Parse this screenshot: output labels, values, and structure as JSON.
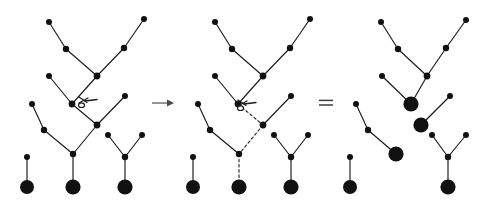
{
  "figure": {
    "background_color": "#ffffff",
    "ink_color": "#111111",
    "width": 487,
    "height": 203
  },
  "operators": [
    {
      "id": "arrow",
      "name": "right-arrow",
      "glyph": "→",
      "x": 163,
      "y": 103
    },
    {
      "id": "equals",
      "name": "equals-sign",
      "glyph": "=",
      "x": 326,
      "y": 103
    }
  ],
  "annotations": [
    {
      "id": "scissors-left",
      "name": "scissors-cut-icon",
      "label": "cut",
      "x": 84,
      "y": 104,
      "panel": "left"
    },
    {
      "id": "scissors-mid",
      "name": "scissors-cut-icon",
      "label": "cut",
      "x": 243,
      "y": 107,
      "panel": "middle"
    }
  ],
  "panels": [
    {
      "id": "panel-left",
      "name": "forest-before-cut",
      "caption": "",
      "nodes": [
        {
          "id": "L1",
          "x": 49,
          "y": 22,
          "r": 3.0,
          "kind": "leaf"
        },
        {
          "id": "L2",
          "x": 66,
          "y": 49,
          "r": 3.2,
          "kind": "internal"
        },
        {
          "id": "L3",
          "x": 97,
          "y": 76,
          "r": 3.4,
          "kind": "internal"
        },
        {
          "id": "L4",
          "x": 124,
          "y": 48,
          "r": 3.2,
          "kind": "internal"
        },
        {
          "id": "L5",
          "x": 144,
          "y": 19,
          "r": 3.0,
          "kind": "leaf"
        },
        {
          "id": "L6",
          "x": 49,
          "y": 76,
          "r": 3.0,
          "kind": "leaf"
        },
        {
          "id": "L7",
          "x": 72,
          "y": 104,
          "r": 3.4,
          "kind": "internal"
        },
        {
          "id": "L8",
          "x": 32,
          "y": 104,
          "r": 3.0,
          "kind": "leaf"
        },
        {
          "id": "L9",
          "x": 44,
          "y": 130,
          "r": 3.2,
          "kind": "internal"
        },
        {
          "id": "L10",
          "x": 97,
          "y": 125,
          "r": 3.4,
          "kind": "internal"
        },
        {
          "id": "L11",
          "x": 125,
          "y": 96,
          "r": 3.0,
          "kind": "leaf"
        },
        {
          "id": "L12",
          "x": 73,
          "y": 154,
          "r": 3.2,
          "kind": "internal"
        },
        {
          "id": "L13",
          "x": 108,
          "y": 135,
          "r": 3.0,
          "kind": "leaf"
        },
        {
          "id": "L14",
          "x": 142,
          "y": 135,
          "r": 3.0,
          "kind": "leaf"
        },
        {
          "id": "L15",
          "x": 125,
          "y": 157,
          "r": 3.2,
          "kind": "internal"
        },
        {
          "id": "L16",
          "x": 27,
          "y": 157,
          "r": 3.0,
          "kind": "leaf"
        },
        {
          "id": "R1",
          "x": 27,
          "y": 187,
          "r": 7.0,
          "kind": "root"
        },
        {
          "id": "R2",
          "x": 73,
          "y": 187,
          "r": 7.6,
          "kind": "root"
        },
        {
          "id": "R3",
          "x": 125,
          "y": 187,
          "r": 7.6,
          "kind": "root"
        }
      ],
      "edges": [
        {
          "from": "L1",
          "to": "L2",
          "style": "solid"
        },
        {
          "from": "L2",
          "to": "L3",
          "style": "solid"
        },
        {
          "from": "L5",
          "to": "L4",
          "style": "solid"
        },
        {
          "from": "L4",
          "to": "L3",
          "style": "solid"
        },
        {
          "from": "L3",
          "to": "L7",
          "style": "solid"
        },
        {
          "from": "L6",
          "to": "L7",
          "style": "solid"
        },
        {
          "from": "L7",
          "to": "L10",
          "style": "solid"
        },
        {
          "from": "L8",
          "to": "L9",
          "style": "solid"
        },
        {
          "from": "L9",
          "to": "L12",
          "style": "solid"
        },
        {
          "from": "L10",
          "to": "L12",
          "style": "solid"
        },
        {
          "from": "L11",
          "to": "L10",
          "style": "solid"
        },
        {
          "from": "L13",
          "to": "L15",
          "style": "solid"
        },
        {
          "from": "L14",
          "to": "L15",
          "style": "solid"
        },
        {
          "from": "L15",
          "to": "R3",
          "style": "solid"
        },
        {
          "from": "L12",
          "to": "R2",
          "style": "solid"
        },
        {
          "from": "L16",
          "to": "R1",
          "style": "solid"
        }
      ]
    },
    {
      "id": "panel-middle",
      "name": "forest-cut-highlighted",
      "caption": "",
      "nodes": [
        {
          "id": "M1",
          "x": 215,
          "y": 22,
          "r": 3.0,
          "kind": "leaf"
        },
        {
          "id": "M2",
          "x": 232,
          "y": 49,
          "r": 3.2,
          "kind": "internal"
        },
        {
          "id": "M3",
          "x": 263,
          "y": 76,
          "r": 3.4,
          "kind": "internal"
        },
        {
          "id": "M4",
          "x": 290,
          "y": 48,
          "r": 3.2,
          "kind": "internal"
        },
        {
          "id": "M5",
          "x": 310,
          "y": 19,
          "r": 3.0,
          "kind": "leaf"
        },
        {
          "id": "M6",
          "x": 215,
          "y": 76,
          "r": 3.0,
          "kind": "leaf"
        },
        {
          "id": "M7",
          "x": 238,
          "y": 104,
          "r": 3.4,
          "kind": "internal"
        },
        {
          "id": "M8",
          "x": 198,
          "y": 104,
          "r": 3.0,
          "kind": "leaf"
        },
        {
          "id": "M9",
          "x": 210,
          "y": 130,
          "r": 3.2,
          "kind": "internal"
        },
        {
          "id": "M10",
          "x": 263,
          "y": 125,
          "r": 3.4,
          "kind": "internal"
        },
        {
          "id": "M11",
          "x": 291,
          "y": 96,
          "r": 3.0,
          "kind": "leaf"
        },
        {
          "id": "M12",
          "x": 239,
          "y": 154,
          "r": 3.2,
          "kind": "internal"
        },
        {
          "id": "M13",
          "x": 274,
          "y": 135,
          "r": 3.0,
          "kind": "leaf"
        },
        {
          "id": "M14",
          "x": 308,
          "y": 135,
          "r": 3.0,
          "kind": "leaf"
        },
        {
          "id": "M15",
          "x": 291,
          "y": 157,
          "r": 3.2,
          "kind": "internal"
        },
        {
          "id": "M16",
          "x": 193,
          "y": 157,
          "r": 3.0,
          "kind": "leaf"
        },
        {
          "id": "S1",
          "x": 193,
          "y": 187,
          "r": 7.0,
          "kind": "root"
        },
        {
          "id": "S2",
          "x": 239,
          "y": 187,
          "r": 7.6,
          "kind": "root"
        },
        {
          "id": "S3",
          "x": 291,
          "y": 187,
          "r": 7.6,
          "kind": "root"
        }
      ],
      "edges": [
        {
          "from": "M1",
          "to": "M2",
          "style": "solid"
        },
        {
          "from": "M2",
          "to": "M3",
          "style": "solid"
        },
        {
          "from": "M5",
          "to": "M4",
          "style": "solid"
        },
        {
          "from": "M4",
          "to": "M3",
          "style": "solid"
        },
        {
          "from": "M3",
          "to": "M7",
          "style": "solid"
        },
        {
          "from": "M6",
          "to": "M7",
          "style": "solid"
        },
        {
          "from": "M7",
          "to": "M10",
          "style": "dashed"
        },
        {
          "from": "M8",
          "to": "M9",
          "style": "solid"
        },
        {
          "from": "M9",
          "to": "M12",
          "style": "solid"
        },
        {
          "from": "M10",
          "to": "M12",
          "style": "dashed"
        },
        {
          "from": "M11",
          "to": "M10",
          "style": "solid"
        },
        {
          "from": "M13",
          "to": "M15",
          "style": "solid"
        },
        {
          "from": "M14",
          "to": "M15",
          "style": "solid"
        },
        {
          "from": "M15",
          "to": "S3",
          "style": "solid"
        },
        {
          "from": "M12",
          "to": "S2",
          "style": "dashed"
        },
        {
          "from": "M16",
          "to": "S1",
          "style": "solid"
        }
      ]
    },
    {
      "id": "panel-right",
      "name": "forest-after-cut",
      "caption": "",
      "nodes": [
        {
          "id": "N1",
          "x": 381,
          "y": 22,
          "r": 3.0,
          "kind": "leaf"
        },
        {
          "id": "N2",
          "x": 398,
          "y": 49,
          "r": 3.2,
          "kind": "internal"
        },
        {
          "id": "N3",
          "x": 427,
          "y": 76,
          "r": 3.4,
          "kind": "internal"
        },
        {
          "id": "N4",
          "x": 446,
          "y": 48,
          "r": 3.2,
          "kind": "internal"
        },
        {
          "id": "N5",
          "x": 466,
          "y": 20,
          "r": 3.0,
          "kind": "leaf"
        },
        {
          "id": "N6",
          "x": 382,
          "y": 76,
          "r": 3.0,
          "kind": "leaf"
        },
        {
          "id": "T1",
          "x": 411,
          "y": 104,
          "r": 7.6,
          "kind": "root"
        },
        {
          "id": "N8",
          "x": 356,
          "y": 104,
          "r": 3.0,
          "kind": "leaf"
        },
        {
          "id": "N9",
          "x": 368,
          "y": 130,
          "r": 3.2,
          "kind": "internal"
        },
        {
          "id": "T2",
          "x": 396,
          "y": 154,
          "r": 7.6,
          "kind": "root"
        },
        {
          "id": "T3",
          "x": 421,
          "y": 125,
          "r": 7.6,
          "kind": "root"
        },
        {
          "id": "N11",
          "x": 450,
          "y": 96,
          "r": 3.0,
          "kind": "leaf"
        },
        {
          "id": "N13",
          "x": 432,
          "y": 135,
          "r": 3.0,
          "kind": "leaf"
        },
        {
          "id": "N14",
          "x": 466,
          "y": 135,
          "r": 3.0,
          "kind": "leaf"
        },
        {
          "id": "N15",
          "x": 448,
          "y": 157,
          "r": 3.2,
          "kind": "internal"
        },
        {
          "id": "N16",
          "x": 350,
          "y": 157,
          "r": 3.0,
          "kind": "leaf"
        },
        {
          "id": "T4",
          "x": 350,
          "y": 187,
          "r": 7.0,
          "kind": "root"
        },
        {
          "id": "T5",
          "x": 448,
          "y": 187,
          "r": 7.6,
          "kind": "root"
        }
      ],
      "edges": [
        {
          "from": "N1",
          "to": "N2",
          "style": "solid"
        },
        {
          "from": "N2",
          "to": "N3",
          "style": "solid"
        },
        {
          "from": "N5",
          "to": "N4",
          "style": "solid"
        },
        {
          "from": "N4",
          "to": "N3",
          "style": "solid"
        },
        {
          "from": "N3",
          "to": "T1",
          "style": "solid"
        },
        {
          "from": "N6",
          "to": "T1",
          "style": "solid"
        },
        {
          "from": "N8",
          "to": "N9",
          "style": "solid"
        },
        {
          "from": "N9",
          "to": "T2",
          "style": "solid"
        },
        {
          "from": "N11",
          "to": "T3",
          "style": "solid"
        },
        {
          "from": "N13",
          "to": "N15",
          "style": "solid"
        },
        {
          "from": "N14",
          "to": "N15",
          "style": "solid"
        },
        {
          "from": "N15",
          "to": "T5",
          "style": "solid"
        },
        {
          "from": "N16",
          "to": "T4",
          "style": "solid"
        }
      ]
    }
  ]
}
